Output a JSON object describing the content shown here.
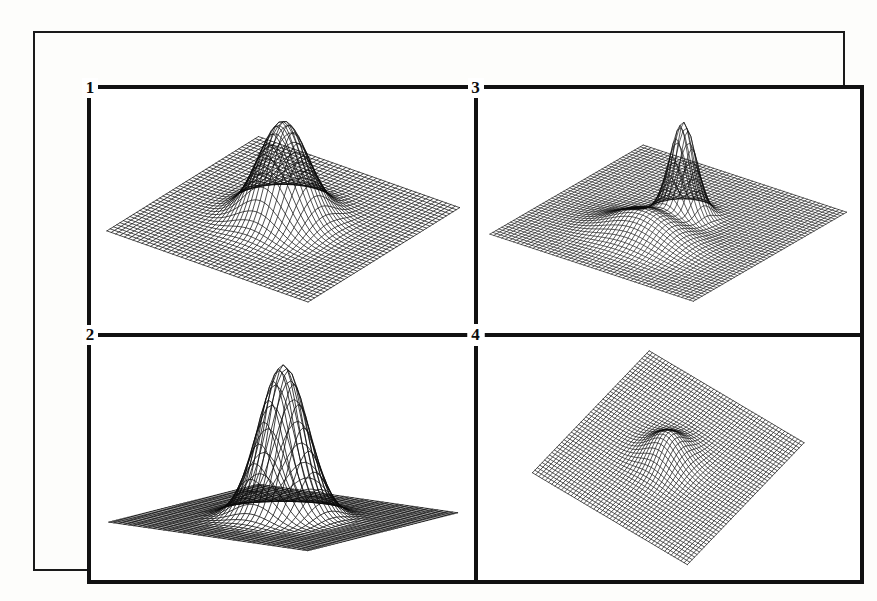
{
  "figure": {
    "background_color": "#fdfdfb",
    "frame_color": "#111111",
    "mesh_color": "#0a0a0a",
    "outer_frame": true,
    "inner_frame": true,
    "layout": "2x2 grid of 3D wireframe surface plots"
  },
  "labels": {
    "panel_1": "1",
    "panel_2": "2",
    "panel_3": "3",
    "panel_4": "4"
  },
  "chart_data": [
    {
      "type": "surface",
      "panel": "1",
      "position": "top-left",
      "title": "",
      "xlabel": "",
      "ylabel": "",
      "zlabel": "",
      "render": "wireframe-mesh",
      "grid": true,
      "legend": "none",
      "view": {
        "azimuth": 37,
        "elevation": 28
      },
      "grid_n": 46,
      "xlim": [
        -3,
        3
      ],
      "ylim": [
        -3,
        3
      ],
      "zlim": [
        0,
        1
      ],
      "z_scale": 0.88,
      "peaks": [
        {
          "amplitude": 1.0,
          "x0": 0.0,
          "y0": 0.0,
          "sigma_x": 0.62,
          "sigma_y": 0.62
        }
      ],
      "description": "Single centered Gaussian peak on a broad flat base, moderate elevation view"
    },
    {
      "type": "surface",
      "panel": "2",
      "position": "bottom-left",
      "title": "",
      "xlabel": "",
      "ylabel": "",
      "zlabel": "",
      "render": "wireframe-mesh",
      "grid": true,
      "legend": "none",
      "view": {
        "azimuth": 37,
        "elevation": 11
      },
      "grid_n": 40,
      "xlim": [
        -3,
        3
      ],
      "ylim": [
        -3,
        3
      ],
      "zlim": [
        0,
        1
      ],
      "z_scale": 1.25,
      "peaks": [
        {
          "amplitude": 1.0,
          "x0": 0.0,
          "y0": 0.0,
          "sigma_x": 0.6,
          "sigma_y": 0.6
        }
      ],
      "description": "Same single Gaussian peak seen from a low elevation angle, base appears nearly edge-on"
    },
    {
      "type": "surface",
      "panel": "3",
      "position": "top-right",
      "title": "",
      "xlabel": "",
      "ylabel": "",
      "zlabel": "",
      "render": "wireframe-mesh",
      "grid": true,
      "legend": "none",
      "view": {
        "azimuth": 37,
        "elevation": 26
      },
      "grid_n": 52,
      "xlim": [
        -3,
        3
      ],
      "ylim": [
        -3,
        3
      ],
      "zlim": [
        0,
        1
      ],
      "z_scale": 0.82,
      "peaks": [
        {
          "amplitude": 1.0,
          "x0": 0.1,
          "y0": -0.45,
          "sigma_x": 0.32,
          "sigma_y": 0.32
        },
        {
          "amplitude": 0.3,
          "x0": 0.05,
          "y0": 0.95,
          "sigma_x": 0.85,
          "sigma_y": 0.6
        }
      ],
      "description": "Narrow tall spike behind a broad low secondary bump in the foreground"
    },
    {
      "type": "surface",
      "panel": "4",
      "position": "bottom-right",
      "title": "",
      "xlabel": "",
      "ylabel": "",
      "zlabel": "",
      "render": "wireframe-mesh",
      "grid": true,
      "legend": "none",
      "view": {
        "azimuth": 37,
        "elevation": 52
      },
      "grid_n": 48,
      "xlim": [
        -3,
        3
      ],
      "ylim": [
        -3,
        3
      ],
      "zlim": [
        0,
        1
      ],
      "z_scale": 0.42,
      "peaks": [
        {
          "amplitude": 1.0,
          "x0": 0.0,
          "y0": 0.05,
          "sigma_x": 0.55,
          "sigma_y": 0.55
        }
      ],
      "description": "Near overhead view of a flat diamond-shaped grid with a small central bump"
    }
  ]
}
